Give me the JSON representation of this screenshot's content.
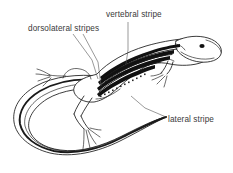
{
  "figure": {
    "background_color": "#ffffff",
    "ink_color": "#1a1a1a",
    "label_color": "#3a3a3a",
    "leader_color": "#555555",
    "width": 233,
    "height": 173
  },
  "labels": {
    "vertebral": {
      "text": "vertebral stripe",
      "x": 106,
      "y": 17
    },
    "dorsolateral": {
      "text": "dorsolateral stripes",
      "x": 28,
      "y": 31
    },
    "lateral": {
      "text": "lateral stripe",
      "x": 168,
      "y": 122
    }
  },
  "anatomy": {
    "parts": [
      "head",
      "eye",
      "forelimb",
      "hindlimb",
      "body",
      "tail",
      "vertebral stripe",
      "dorsolateral stripes",
      "lateral stripe"
    ]
  }
}
